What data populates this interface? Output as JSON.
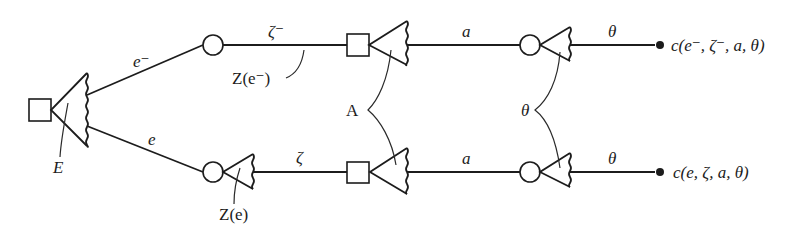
{
  "figure": {
    "type": "game-tree"
  },
  "labels": {
    "root_decision": "E",
    "branch_upper": "e⁻",
    "branch_lower": "e",
    "chance_upper_label": "Z(e⁻)",
    "chance_lower_label": "Z(e)",
    "zeta_upper": "ζ⁻",
    "zeta_lower": "ζ",
    "decision_group": "A",
    "act_upper": "a",
    "act_lower": "a",
    "state_group": "θ",
    "state_upper": "θ",
    "state_lower": "θ",
    "outcome_upper": "c(e⁻, ζ⁻, a, θ)",
    "outcome_lower": "c(e, ζ, a, θ)"
  },
  "nodes": [
    {
      "id": "E",
      "kind": "decision",
      "shape": "square"
    },
    {
      "id": "Z_upper",
      "kind": "chance",
      "shape": "circle"
    },
    {
      "id": "Z_lower",
      "kind": "chance",
      "shape": "circle"
    },
    {
      "id": "A_upper",
      "kind": "decision",
      "shape": "square"
    },
    {
      "id": "A_lower",
      "kind": "decision",
      "shape": "square"
    },
    {
      "id": "theta_upper",
      "kind": "chance",
      "shape": "circle"
    },
    {
      "id": "theta_lower",
      "kind": "chance",
      "shape": "circle"
    },
    {
      "id": "c_upper",
      "kind": "outcome",
      "shape": "dot"
    },
    {
      "id": "c_lower",
      "kind": "outcome",
      "shape": "dot"
    }
  ],
  "colors": {
    "ink": "#1c1c1c",
    "background": "#ffffff"
  }
}
